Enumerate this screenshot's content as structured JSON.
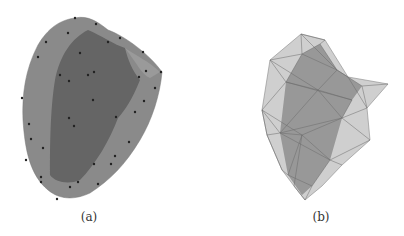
{
  "figure": {
    "panels": [
      {
        "id": "a",
        "caption": "(a)",
        "description": "smooth surface rendering with sample points"
      },
      {
        "id": "b",
        "caption": "(b)",
        "description": "triangulated wireframe mesh rendering"
      }
    ]
  }
}
